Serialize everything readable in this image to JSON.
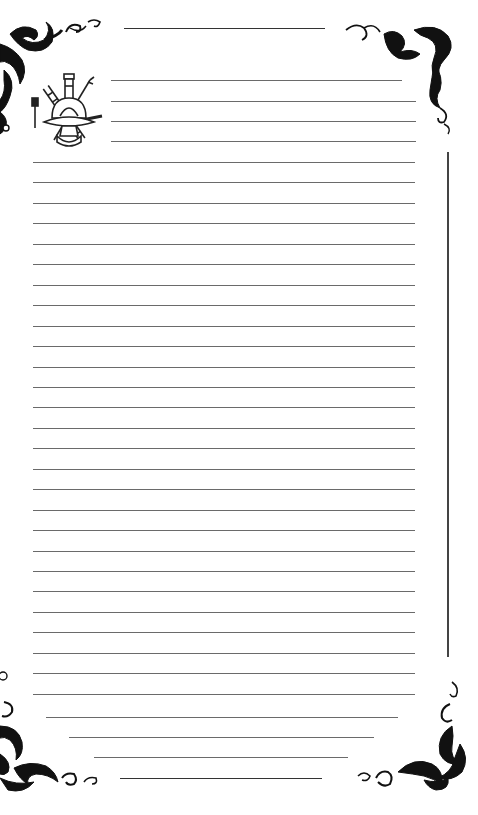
{
  "page": {
    "type": "lined-stationery",
    "background": "#ffffff",
    "line_color": "#6a6a6a",
    "ornament_color": "#111111"
  },
  "emblem": {
    "icon": "firefighter-maltese-emblem-icon",
    "elements": [
      "helmet",
      "ladder",
      "axe",
      "hammer",
      "pike-pole",
      "hydrant"
    ]
  },
  "top_rule": {
    "x1": 124,
    "x2": 325,
    "y": 28
  },
  "bottom_rule": {
    "x1": 120,
    "x2": 322,
    "y": 778
  },
  "right_vertical_rule": {
    "x": 448,
    "y1": 152,
    "y2": 657
  },
  "header_lines": [
    {
      "x1": 111,
      "x2": 402,
      "y": 80
    },
    {
      "x1": 111,
      "x2": 416,
      "y": 101
    },
    {
      "x1": 111,
      "x2": 416,
      "y": 121
    },
    {
      "x1": 111,
      "x2": 416,
      "y": 141
    }
  ],
  "body_lines": {
    "x1": 33,
    "x2": 415,
    "y_start": 162,
    "pitch": 20.45,
    "count": 27
  },
  "tail_lines": [
    {
      "x1": 46,
      "x2": 398,
      "y": 717
    },
    {
      "x1": 69,
      "x2": 374,
      "y": 737
    },
    {
      "x1": 94,
      "x2": 348,
      "y": 757
    }
  ],
  "corner_ornaments": [
    "top-left",
    "top-right",
    "bottom-left",
    "bottom-right"
  ]
}
